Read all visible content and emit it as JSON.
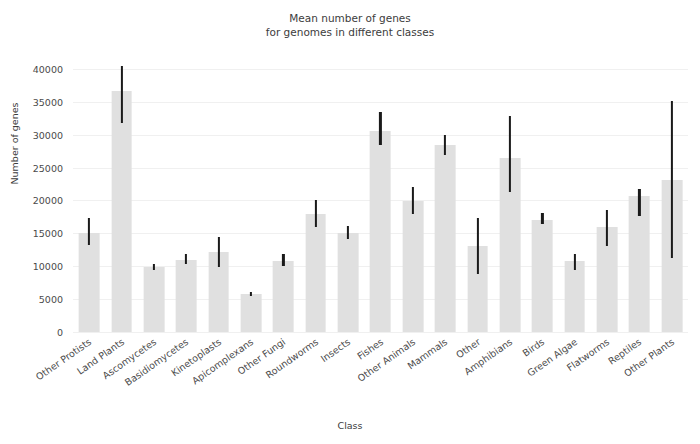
{
  "chart_data": {
    "type": "bar",
    "title": "Mean number of genes\nfor genomes in different classes",
    "xlabel": "Class",
    "ylabel": "Number of genes",
    "ylim": [
      0,
      41500
    ],
    "yticks": [
      0,
      5000,
      10000,
      15000,
      20000,
      25000,
      30000,
      35000,
      40000
    ],
    "ytick_labels": [
      "0",
      "5000",
      "10000",
      "15000",
      "20000",
      "25000",
      "30000",
      "35000",
      "40000"
    ],
    "grid": true,
    "legend": "none",
    "bar_color": "#e0e0e0",
    "errorbar_color": "#1a1a1a",
    "categories": [
      "Other Protists",
      "Land Plants",
      "Ascomycetes",
      "Basidiomycetes",
      "Kinetoplasts",
      "Apicomplexans",
      "Other Fungi",
      "Roundworms",
      "Insects",
      "Fishes",
      "Other Animals",
      "Mammals",
      "Other",
      "Amphibians",
      "Birds",
      "Green Algae",
      "Flatworms",
      "Reptiles",
      "Other Plants"
    ],
    "values": [
      15000,
      36700,
      9900,
      11000,
      12100,
      5800,
      10800,
      17900,
      15000,
      30600,
      19900,
      28500,
      13000,
      26400,
      17100,
      10800,
      16000,
      20700,
      23100
    ],
    "error_low": [
      13300,
      31700,
      9400,
      10400,
      9900,
      5500,
      10100,
      16000,
      14200,
      28400,
      17900,
      26900,
      8800,
      21300,
      16400,
      9400,
      13000,
      17700,
      11300
    ],
    "error_high": [
      17400,
      40500,
      10400,
      11800,
      14400,
      6100,
      11800,
      20000,
      16100,
      33500,
      22000,
      30000,
      17400,
      32900,
      18100,
      11800,
      18600,
      21800,
      35100
    ]
  }
}
